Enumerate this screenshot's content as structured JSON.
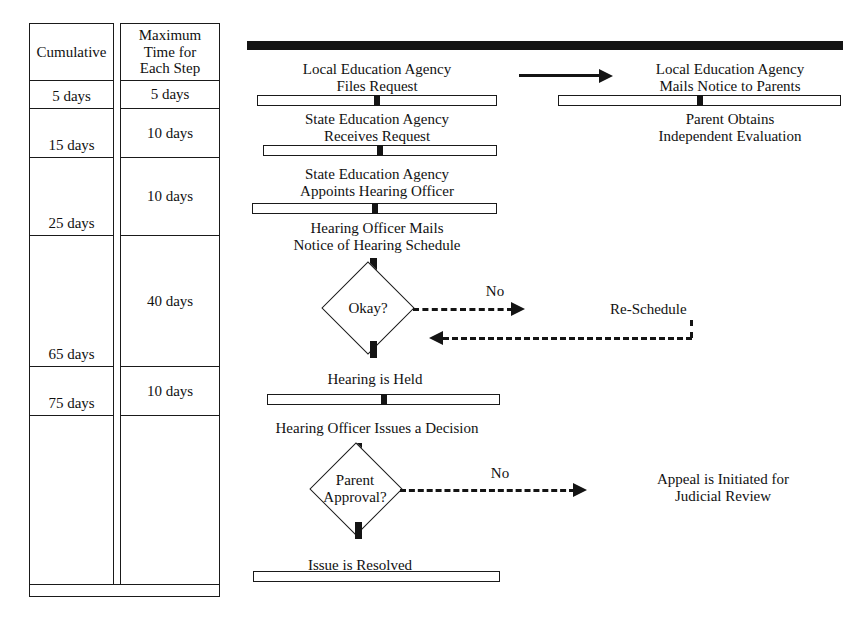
{
  "table": {
    "columns": [
      {
        "name": "cumulative",
        "header": "Cumulative",
        "cells": [
          "5 days",
          "15 days",
          "25 days",
          "65 days",
          "75 days",
          ""
        ]
      },
      {
        "name": "maximum_time_each_step",
        "header": "Maximum\nTime for\nEach Step",
        "header_lines": [
          "Maximum",
          "Time for",
          "Each Step"
        ],
        "cells": [
          "5 days",
          "10 days",
          "10 days",
          "40 days",
          "10 days",
          ""
        ]
      }
    ]
  },
  "flow": {
    "nodes": [
      {
        "id": "lea_files",
        "lines": [
          "Local Education Agency",
          "Files Request"
        ]
      },
      {
        "id": "lea_mails",
        "lines": [
          "Local Education Agency",
          "Mails Notice to Parents"
        ]
      },
      {
        "id": "sea_receives",
        "lines": [
          "State Education Agency",
          "Receives Request"
        ]
      },
      {
        "id": "parent_obtains",
        "lines": [
          "Parent Obtains",
          "Independent Evaluation"
        ]
      },
      {
        "id": "sea_appoints",
        "lines": [
          "State Education Agency",
          "Appoints Hearing Officer"
        ]
      },
      {
        "id": "ho_mails",
        "lines": [
          "Hearing Officer Mails",
          "Notice of Hearing Schedule"
        ]
      },
      {
        "id": "hearing_held",
        "lines": [
          "Hearing is Held"
        ]
      },
      {
        "id": "ho_decision",
        "lines": [
          "Hearing Officer Issues a Decision"
        ]
      },
      {
        "id": "issue_resolved",
        "lines": [
          "Issue is Resolved"
        ]
      },
      {
        "id": "re_schedule",
        "lines": [
          "Re-Schedule"
        ]
      },
      {
        "id": "appeal",
        "lines": [
          "Appeal is Initiated for",
          "Judicial Review"
        ]
      }
    ],
    "decisions": [
      {
        "id": "okay",
        "lines": [
          "Okay?"
        ]
      },
      {
        "id": "parent_approval",
        "lines": [
          "Parent",
          "Approval?"
        ]
      }
    ],
    "edge_labels": {
      "okay_no": "No",
      "parent_no": "No"
    },
    "colors": {
      "ink": "#141414",
      "paper": "#ffffff"
    }
  }
}
